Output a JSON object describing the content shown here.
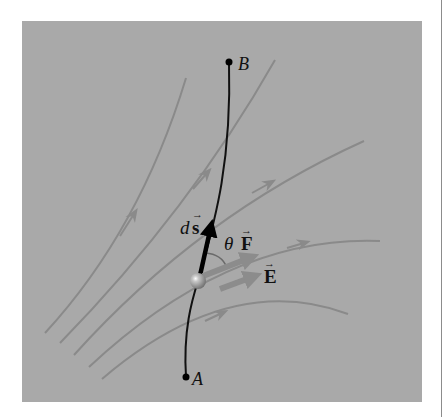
{
  "figure": {
    "panel_color": "#a9a9a9",
    "field_line_color": "#8a8a8a",
    "path_color": "#111111",
    "points": {
      "A": {
        "label": "A"
      },
      "B": {
        "label": "B"
      }
    },
    "vectors": {
      "ds": {
        "prefix": "d",
        "symbol": "s"
      },
      "F": {
        "symbol": "F"
      },
      "E": {
        "symbol": "E"
      }
    },
    "angle": {
      "symbol": "θ"
    },
    "arrow_mark": "→",
    "field_line_count": 5
  }
}
